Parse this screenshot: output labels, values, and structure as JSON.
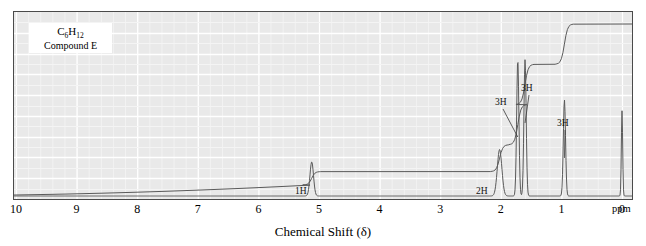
{
  "figure": {
    "caption_formula": "C6H12",
    "caption_formula_parts": {
      "pre": "C",
      "sub1": "6",
      "mid": "H",
      "sub2": "12"
    },
    "caption_name": "Compound E",
    "xaxis_title": "Chemical Shift (δ)",
    "xaxis_unit": "ppm",
    "background_color": "#e9e9e9",
    "grid_color": "#ffffff",
    "trace_color": "#5a5a5a",
    "frame_color": "#4a4a4a"
  },
  "chart_data": {
    "type": "line",
    "title": "",
    "subtitle": "",
    "xlabel": "Chemical Shift (δ)",
    "ylabel": "",
    "xlim": [
      10,
      0
    ],
    "ylim": [
      0,
      100
    ],
    "grid": true,
    "legend": "none",
    "x_ticks": [
      10,
      9,
      8,
      7,
      6,
      5,
      4,
      3,
      2,
      1,
      0
    ],
    "x_tick_labels": [
      "10",
      "9",
      "8",
      "7",
      "6",
      "5",
      "4",
      "3",
      "2",
      "1",
      "0"
    ],
    "x_unit": "ppm",
    "series": [
      {
        "name": "1H NMR spectrum",
        "type": "spectrum",
        "peaks": [
          {
            "shift": 5.12,
            "height": 22,
            "width": 0.035,
            "integration": "1H"
          },
          {
            "shift": 2.02,
            "height": 30,
            "width": 0.045,
            "integration": "2H"
          },
          {
            "shift": 1.72,
            "height": 88,
            "width": 0.022,
            "integration": "3H"
          },
          {
            "shift": 1.6,
            "height": 88,
            "width": 0.022,
            "integration": "3H"
          },
          {
            "shift": 0.95,
            "height": 62,
            "width": 0.022,
            "integration": "3H"
          },
          {
            "shift": 0.0,
            "height": 55,
            "width": 0.013,
            "integration": "TMS"
          }
        ]
      },
      {
        "name": "integral trace",
        "type": "integral",
        "steps": [
          {
            "shift": 5.12,
            "rise": 1
          },
          {
            "shift": 2.02,
            "rise": 2
          },
          {
            "shift": 1.72,
            "rise": 3
          },
          {
            "shift": 1.6,
            "rise": 3
          },
          {
            "shift": 0.95,
            "rise": 3
          }
        ]
      }
    ],
    "annotations": [
      {
        "label": "1H",
        "shift": 5.12,
        "x_px": 295,
        "y_px": 186
      },
      {
        "label": "2H",
        "shift": 2.02,
        "x_px": 476,
        "y_px": 186
      },
      {
        "label": "3H",
        "shift": 1.72,
        "x_px": 495,
        "y_px": 97
      },
      {
        "label": "3H",
        "shift": 1.6,
        "x_px": 521,
        "y_px": 83
      },
      {
        "label": "3H",
        "shift": 0.95,
        "x_px": 557,
        "y_px": 118
      }
    ]
  }
}
